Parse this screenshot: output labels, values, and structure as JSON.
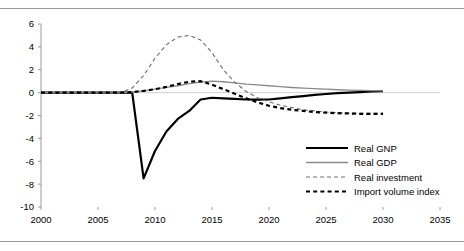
{
  "chart_data": {
    "type": "line",
    "title": "",
    "subtitle": "",
    "xlabel": "",
    "ylabel": "",
    "xlim": [
      2000,
      2035
    ],
    "ylim": [
      -10,
      6
    ],
    "xticks": [
      2000,
      2005,
      2010,
      2015,
      2020,
      2025,
      2030,
      2035
    ],
    "yticks": [
      6,
      4,
      2,
      0,
      -2,
      -4,
      -6,
      -8,
      -10
    ],
    "xtick_labels": [
      "2000",
      "2005",
      "2010",
      "2015",
      "2020",
      "2025",
      "2030",
      "2035"
    ],
    "ytick_labels": [
      "6",
      "4",
      "2",
      "0",
      "-2",
      "-4",
      "-6",
      "-8",
      "-10"
    ],
    "grid": false,
    "zero_line": true,
    "legend_position": "bottom-right",
    "series": [
      {
        "name": "Real GNP",
        "style": "solid",
        "color": "#000000",
        "width": 2.2,
        "x": [
          2000,
          2001,
          2002,
          2003,
          2004,
          2005,
          2006,
          2007,
          2008,
          2009,
          2010,
          2011,
          2012,
          2013,
          2014,
          2015,
          2016,
          2017,
          2018,
          2019,
          2020,
          2021,
          2022,
          2023,
          2024,
          2025,
          2026,
          2027,
          2028,
          2029,
          2030
        ],
        "values": [
          0,
          0,
          0,
          0,
          0,
          0,
          0,
          0,
          0.0,
          -7.5,
          -5.1,
          -3.4,
          -2.3,
          -1.6,
          -0.6,
          -0.45,
          -0.5,
          -0.55,
          -0.6,
          -0.62,
          -0.6,
          -0.5,
          -0.4,
          -0.3,
          -0.2,
          -0.12,
          -0.05,
          0.0,
          0.05,
          0.1,
          0.12
        ]
      },
      {
        "name": "Real GDP",
        "style": "solid",
        "color": "#8a8a8a",
        "width": 1.3,
        "x": [
          2000,
          2001,
          2002,
          2003,
          2004,
          2005,
          2006,
          2007,
          2008,
          2009,
          2010,
          2011,
          2012,
          2013,
          2014,
          2015,
          2016,
          2017,
          2018,
          2019,
          2020,
          2021,
          2022,
          2023,
          2024,
          2025,
          2026,
          2027,
          2028,
          2029,
          2030
        ],
        "values": [
          0,
          0,
          0,
          0,
          0,
          0,
          0,
          0,
          0.05,
          0.15,
          0.3,
          0.45,
          0.6,
          0.78,
          0.92,
          1.0,
          0.95,
          0.85,
          0.75,
          0.68,
          0.6,
          0.52,
          0.45,
          0.4,
          0.35,
          0.3,
          0.25,
          0.22,
          0.2,
          0.18,
          0.16
        ]
      },
      {
        "name": "Real investment",
        "style": "dashed-thin",
        "color": "#6e6e6e",
        "width": 1.1,
        "x": [
          2000,
          2001,
          2002,
          2003,
          2004,
          2005,
          2006,
          2007,
          2008,
          2009,
          2010,
          2011,
          2012,
          2013,
          2014,
          2015,
          2016,
          2017,
          2018,
          2019,
          2020,
          2021,
          2022,
          2023,
          2024,
          2025,
          2026,
          2027,
          2028,
          2029,
          2030
        ],
        "values": [
          0,
          0,
          0,
          0,
          0,
          0,
          0,
          0,
          0.4,
          1.5,
          3.0,
          4.2,
          4.85,
          5.0,
          4.6,
          3.5,
          2.0,
          0.9,
          0.1,
          -0.45,
          -0.8,
          -1.1,
          -1.3,
          -1.5,
          -1.6,
          -1.7,
          -1.75,
          -1.8,
          -1.8,
          -1.8,
          -1.8
        ]
      },
      {
        "name": "Import volume index",
        "style": "dashed-thick",
        "color": "#000000",
        "width": 2.2,
        "x": [
          2000,
          2001,
          2002,
          2003,
          2004,
          2005,
          2006,
          2007,
          2008,
          2009,
          2010,
          2011,
          2012,
          2013,
          2014,
          2015,
          2016,
          2017,
          2018,
          2019,
          2020,
          2021,
          2022,
          2023,
          2024,
          2025,
          2026,
          2027,
          2028,
          2029,
          2030
        ],
        "values": [
          0,
          0,
          0,
          0,
          0,
          0,
          0,
          0,
          0.05,
          0.15,
          0.3,
          0.5,
          0.75,
          0.95,
          1.0,
          0.7,
          0.3,
          -0.1,
          -0.5,
          -0.85,
          -1.15,
          -1.35,
          -1.5,
          -1.6,
          -1.7,
          -1.75,
          -1.8,
          -1.82,
          -1.85,
          -1.85,
          -1.85
        ]
      }
    ]
  },
  "legend": {
    "entries": [
      {
        "label": "Real GNP"
      },
      {
        "label": "Real GDP"
      },
      {
        "label": "Real investment"
      },
      {
        "label": "Import volume index"
      }
    ]
  },
  "colors": {
    "axis": "#9a9a9a",
    "zero_line": "#cfcfcf",
    "rule": "#9a9a9a",
    "gnp": "#000000",
    "gdp": "#8a8a8a",
    "investment": "#6e6e6e",
    "imports": "#000000",
    "background": "#ffffff"
  }
}
